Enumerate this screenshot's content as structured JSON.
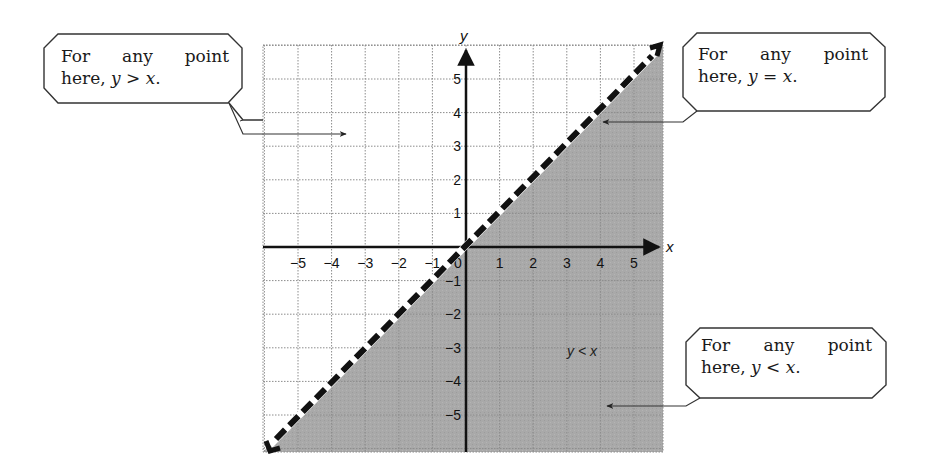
{
  "figure": {
    "colors": {
      "shade": "#a8a8a8",
      "grid": "#8c8c8c",
      "axis": "#111111",
      "boundary": "#111111",
      "callout_border": "#333333"
    }
  },
  "axes": {
    "x_label": "x",
    "y_label": "y",
    "x_ticks": [
      "−5",
      "−4",
      "−3",
      "−2",
      "−1",
      "0",
      "1",
      "2",
      "3",
      "4",
      "5"
    ],
    "y_ticks": [
      "5",
      "4",
      "3",
      "2",
      "1",
      "−1",
      "−2",
      "−3",
      "−4",
      "−5"
    ],
    "range": [
      -6,
      6
    ]
  },
  "boundary_line": {
    "equation": "y = x",
    "style": "dashed",
    "arrows": "both ends"
  },
  "region_label": "y < x",
  "callouts": [
    {
      "id": "above",
      "line1": [
        "For",
        "any",
        "point"
      ],
      "line2_prefix": "here, ",
      "var_left": "y",
      "op": " > ",
      "var_right": "x",
      "end": "."
    },
    {
      "id": "on",
      "line1": [
        "For",
        "any",
        "point"
      ],
      "line2_prefix": "here, ",
      "var_left": "y",
      "op": " = ",
      "var_right": "x",
      "end": "."
    },
    {
      "id": "below",
      "line1": [
        "For",
        "any",
        "point"
      ],
      "line2_prefix": "here, ",
      "var_left": "y",
      "op": " < ",
      "var_right": "x",
      "end": "."
    }
  ]
}
